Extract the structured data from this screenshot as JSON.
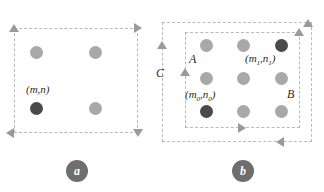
{
  "figure": {
    "type": "diagram",
    "background": "#ffffff",
    "panels": [
      {
        "id": "a",
        "caption": "a",
        "boxes": [
          {
            "name": "outer-window",
            "x": 14,
            "y": 28,
            "w": 124,
            "h": 105
          }
        ],
        "grid": {
          "rows": 2,
          "cols": 2
        },
        "dots": [
          {
            "name": "dot-r0c0",
            "x": 36,
            "y": 52,
            "state": "light"
          },
          {
            "name": "dot-r0c1",
            "x": 95,
            "y": 52,
            "state": "light"
          },
          {
            "name": "dot-r1c0",
            "x": 36,
            "y": 108,
            "state": "dark"
          },
          {
            "name": "dot-r1c1",
            "x": 95,
            "y": 108,
            "state": "light"
          }
        ],
        "labels": [
          {
            "name": "label-mn",
            "text": "(m,n)",
            "x": 26,
            "y": 88
          }
        ],
        "arrows": [
          {
            "name": "arrow-top-left-up",
            "dir": "up",
            "x": 14,
            "y": 28
          },
          {
            "name": "arrow-top-right-right",
            "dir": "right",
            "x": 138,
            "y": 28
          },
          {
            "name": "arrow-bottom-left-left",
            "dir": "left",
            "x": 14,
            "y": 133
          },
          {
            "name": "arrow-bottom-right-down",
            "dir": "down",
            "x": 138,
            "y": 133
          }
        ]
      },
      {
        "id": "b",
        "caption": "b",
        "boxes": [
          {
            "name": "outer-window",
            "x": 162,
            "y": 22,
            "w": 150,
            "h": 120
          },
          {
            "name": "inner-window",
            "x": 185,
            "y": 32,
            "w": 115,
            "h": 96
          }
        ],
        "grid": {
          "rows": 3,
          "cols": 3
        },
        "dots": [
          {
            "name": "dot-r0c0",
            "x": 206,
            "y": 45,
            "state": "light"
          },
          {
            "name": "dot-r0c1",
            "x": 243,
            "y": 45,
            "state": "light"
          },
          {
            "name": "dot-r0c2",
            "x": 281,
            "y": 45,
            "state": "dark"
          },
          {
            "name": "dot-r1c0",
            "x": 206,
            "y": 78,
            "state": "light"
          },
          {
            "name": "dot-r1c1",
            "x": 243,
            "y": 78,
            "state": "light"
          },
          {
            "name": "dot-r1c2",
            "x": 281,
            "y": 78,
            "state": "light"
          },
          {
            "name": "dot-r2c0",
            "x": 206,
            "y": 111,
            "state": "dark"
          },
          {
            "name": "dot-r2c1",
            "x": 243,
            "y": 111,
            "state": "light"
          },
          {
            "name": "dot-r2c2",
            "x": 281,
            "y": 111,
            "state": "light"
          }
        ],
        "labels": [
          {
            "name": "label-m1n1",
            "text": "(m1,n1)",
            "base": "(m",
            "sub1": "1",
            "mid": ",n",
            "sub2": "1",
            "close": ")",
            "x": 247,
            "y": 57
          },
          {
            "name": "label-m0n0",
            "text": "(m0,n0)",
            "base": "(m",
            "sub1": "0",
            "mid": ",n",
            "sub2": "0",
            "close": ")",
            "x": 187,
            "y": 93
          },
          {
            "name": "label-a",
            "text": "A",
            "x": 190,
            "y": 57
          },
          {
            "name": "label-b",
            "text": "B",
            "x": 288,
            "y": 92
          },
          {
            "name": "label-c",
            "text": "C",
            "x": 156,
            "y": 71
          }
        ],
        "arrows": [
          {
            "name": "arrow-outer-left-up",
            "dir": "up",
            "x": 162,
            "y": 45
          },
          {
            "name": "arrow-outer-top-right-up",
            "dir": "up",
            "x": 303,
            "y": 22
          },
          {
            "name": "arrow-outer-bottom-left",
            "dir": "left",
            "x": 280,
            "y": 142
          },
          {
            "name": "arrow-inner-left-up",
            "dir": "up",
            "x": 185,
            "y": 72
          },
          {
            "name": "arrow-inner-top-right-up",
            "dir": "up",
            "x": 294,
            "y": 32
          },
          {
            "name": "arrow-inner-bottom-right",
            "dir": "right",
            "x": 240,
            "y": 128
          }
        ]
      }
    ],
    "captions": [
      {
        "name": "caption-badge-a",
        "text": "a",
        "x": 66,
        "y": 160
      },
      {
        "name": "caption-badge-b",
        "text": "b",
        "x": 232,
        "y": 160
      }
    ],
    "colors": {
      "dot_light": "#a8a8a8",
      "dot_dark": "#4a4a4a",
      "dash": "#b9b9b9",
      "arrow": "#9a9a9a",
      "badge": "#6e6e6e",
      "text": "#2b2b2b"
    }
  }
}
